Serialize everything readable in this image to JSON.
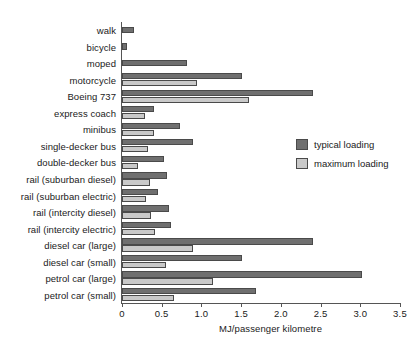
{
  "chart_data": {
    "type": "bar",
    "orientation": "horizontal",
    "title": "",
    "xlabel": "MJ/passenger kilometre",
    "ylabel": "",
    "xlim": [
      0,
      3.5
    ],
    "xticks": [
      "0",
      "0.5",
      "1.0",
      "1.5",
      "2.0",
      "2.5",
      "3.0",
      "3.5"
    ],
    "xtick_values": [
      0,
      0.5,
      1.0,
      1.5,
      2.0,
      2.5,
      3.0,
      3.5
    ],
    "grid": false,
    "legend_position": "right-middle",
    "categories": [
      "walk",
      "bicycle",
      "moped",
      "motorcycle",
      "Boeing 737",
      "express coach",
      "minibus",
      "single-decker bus",
      "double-decker bus",
      "rail (suburban diesel)",
      "rail (suburban electric)",
      "rail (intercity diesel)",
      "rail (intercity electric)",
      "diesel car (large)",
      "diesel car (small)",
      "petrol car (large)",
      "petrol car (small)"
    ],
    "series": [
      {
        "name": "typical loading",
        "color": "#6f6f6f",
        "values": [
          0.15,
          0.06,
          0.82,
          1.51,
          2.4,
          0.4,
          0.73,
          0.89,
          0.53,
          0.57,
          0.45,
          0.59,
          0.62,
          2.4,
          1.51,
          3.02,
          1.69
        ]
      },
      {
        "name": "maximum loading",
        "color": "#c9c9c9",
        "values": [
          null,
          null,
          null,
          0.95,
          1.6,
          0.29,
          0.4,
          0.33,
          0.2,
          0.35,
          0.3,
          0.37,
          0.41,
          0.9,
          0.55,
          1.14,
          0.66
        ]
      }
    ]
  },
  "legend": {
    "items": [
      {
        "label": "typical loading",
        "swatch": "typical"
      },
      {
        "label": "maximum loading",
        "swatch": "maximum"
      }
    ]
  }
}
